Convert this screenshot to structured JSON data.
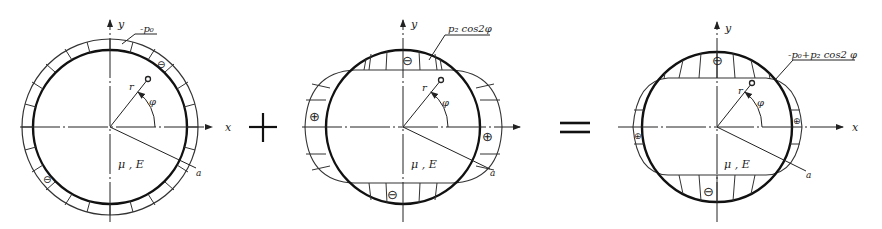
{
  "figures": [
    {
      "id": "uniform-pressure",
      "axis_x": "x",
      "axis_y": "y",
      "radius_label": "r",
      "angle_label": "φ",
      "material_label": "μ , E",
      "boundary_label": "a",
      "load_label": "-p₀",
      "sign_markers": [
        "⊖",
        "⊖"
      ]
    },
    {
      "id": "cosine-pressure",
      "axis_x": "x",
      "axis_y": "y",
      "radius_label": "r",
      "angle_label": "φ",
      "material_label": "μ , E",
      "boundary_label": "a",
      "load_label": "p₂ cos2φ",
      "sign_markers": [
        "⊖",
        "⊖",
        "⊕",
        "⊕"
      ]
    },
    {
      "id": "combined-pressure",
      "axis_x": "x",
      "axis_y": "y",
      "radius_label": "r",
      "angle_label": "φ",
      "material_label": "μ , E",
      "boundary_label": "a",
      "load_label": "-p₀+p₂ cos2 φ",
      "sign_markers": [
        "⊖",
        "⊖",
        "⊕",
        "⊕"
      ]
    }
  ],
  "operators": {
    "plus": "+",
    "equals": "="
  }
}
